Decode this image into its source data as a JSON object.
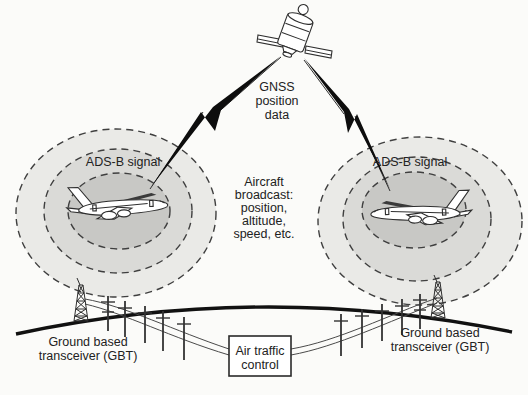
{
  "colors": {
    "ink": "#2e2e2e",
    "paper": "#fbfbf9",
    "ring-outer": "#eaeae7",
    "ring-middle": "#dadad7",
    "ring-inner": "#c8c8c5",
    "text": "#222222"
  },
  "labels": {
    "gnss": [
      "GNSS",
      "position",
      "data"
    ],
    "adsb_left": "ADS-B signal",
    "adsb_right": "ADS-B signal",
    "broadcast": [
      "Aircraft",
      "broadcast:",
      "position,",
      "altitude,",
      "speed, etc."
    ],
    "gbt_left": [
      "Ground based",
      "transceiver (GBT)"
    ],
    "gbt_right": [
      "Ground based",
      "transceiver (GBT)"
    ],
    "atc": [
      "Air traffic",
      "control"
    ]
  },
  "icons": {
    "satellite": "satellite-icon",
    "aircraft_left": "aircraft-icon",
    "aircraft_right": "aircraft-icon",
    "tower_left": "radio-tower-icon",
    "tower_right": "radio-tower-icon",
    "bolt_left": "lightning-arrow-icon",
    "bolt_right": "lightning-arrow-icon",
    "poles": "utility-pole-icon",
    "ground": "earth-curve"
  }
}
